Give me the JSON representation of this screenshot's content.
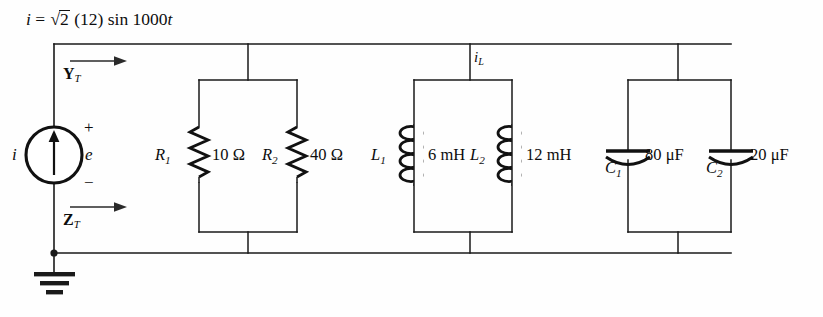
{
  "figure": {
    "type": "ac-circuit-schematic",
    "width": 823,
    "height": 317,
    "background_color": "#ffffff",
    "line_color": "#1a1a1a"
  },
  "source": {
    "equation_prefix": "i",
    "equation_equals": "=",
    "equation_radical": "√",
    "equation_radicand": "2",
    "equation_amplitude": "(12)",
    "equation_function": "sin",
    "equation_argument": "1000",
    "equation_variable": "t",
    "symbol_name": "current-source",
    "current_label": "i",
    "polarity_plus": "+",
    "polarity_minus": "−",
    "voltage_label": "e"
  },
  "annotations": {
    "admittance_symbol": "Y",
    "admittance_subscript": "T",
    "impedance_symbol": "Z",
    "impedance_subscript": "T",
    "inductor_current_symbol": "i",
    "inductor_current_subscript": "L"
  },
  "components": [
    {
      "id": "R1",
      "kind": "resistor",
      "refdes": "R",
      "subscript": "1",
      "value": "10",
      "unit": "Ω",
      "value_label": "10 Ω",
      "branch_x": 199
    },
    {
      "id": "R2",
      "kind": "resistor",
      "refdes": "R",
      "subscript": "2",
      "value": "40",
      "unit": "Ω",
      "value_label": "40 Ω",
      "branch_x": 297
    },
    {
      "id": "L1",
      "kind": "inductor",
      "refdes": "L",
      "subscript": "1",
      "value": "6",
      "unit": "mH",
      "value_label": "6 mH",
      "branch_x": 414
    },
    {
      "id": "L2",
      "kind": "inductor",
      "refdes": "L",
      "subscript": "2",
      "value": "12",
      "unit": "mH",
      "value_label": "12 mH",
      "branch_x": 512
    },
    {
      "id": "C1",
      "kind": "capacitor",
      "refdes": "C",
      "subscript": "1",
      "value": "80",
      "unit": "μF",
      "value_label": "80 μF",
      "branch_x": 628
    },
    {
      "id": "C2",
      "kind": "capacitor",
      "refdes": "C",
      "subscript": "2",
      "value": "20",
      "unit": "μF",
      "value_label": "20 μF",
      "branch_x": 731
    }
  ],
  "nodes": {
    "ground_label": "ground",
    "top_rail_y": 44,
    "bottom_rail_y": 253,
    "sub_rail_top_y": 80,
    "sub_rail_bottom_y": 232,
    "left_rail_x": 54
  }
}
